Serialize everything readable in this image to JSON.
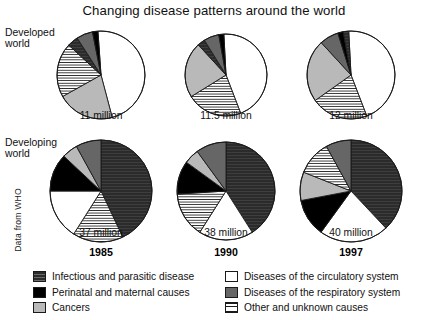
{
  "title": "Changing disease patterns around the world",
  "source_note": "Data from WHO",
  "rows": {
    "developed": "Developed\nworld",
    "developed_line1": "Developed",
    "developed_line2": "world",
    "developing_line1": "Developing",
    "developing_line2": "world"
  },
  "years": [
    "1985",
    "1990",
    "1997"
  ],
  "captions": {
    "developed": [
      "11 million",
      "11.5 million",
      "12 million"
    ],
    "developing": [
      "37 million",
      "38 million",
      "40 million"
    ]
  },
  "legend": {
    "left": [
      {
        "label": "Infectious and parasitic disease",
        "key": "infectious",
        "swatch": "sw-infectious"
      },
      {
        "label": "Perinatal and maternal causes",
        "key": "perinatal",
        "swatch": "sw-perinatal"
      },
      {
        "label": "Cancers",
        "key": "cancers",
        "swatch": "sw-cancers"
      }
    ],
    "right": [
      {
        "label": "Diseases of the circulatory system",
        "key": "circulatory",
        "swatch": "sw-circulatory"
      },
      {
        "label": "Diseases of the respiratory system",
        "key": "respiratory",
        "swatch": "sw-respiratory"
      },
      {
        "label": "Other and unknown causes",
        "key": "other",
        "swatch": "sw-other"
      }
    ]
  },
  "colors": {
    "infectious": "#2b2b2b",
    "perinatal": "#000000",
    "cancers": "#b9b9b9",
    "circulatory": "#ffffff",
    "respiratory": "#666666",
    "other": "#ffffff",
    "outline": "#1a1a1a",
    "text": "#101010",
    "background": "#ffffff"
  },
  "chart_data": {
    "type": "pie",
    "title": "Changing disease patterns around the world",
    "subtitle": "",
    "xlabel": "",
    "ylabel": "",
    "units": "percent of total deaths",
    "legend_position": "bottom",
    "grid": false,
    "categories": [
      "Infectious and parasitic disease",
      "Perinatal and maternal causes",
      "Cancers",
      "Diseases of the circulatory system",
      "Diseases of the respiratory system",
      "Other and unknown causes"
    ],
    "panels": [
      {
        "group": "Developed world",
        "year": "1985",
        "total_label": "11 million",
        "total_millions": 11,
        "values": [
          4,
          2,
          21,
          47,
          6,
          20
        ],
        "slices": [
          {
            "category": "Diseases of the circulatory system",
            "percent": 47,
            "fill": "#ffffff"
          },
          {
            "category": "Cancers",
            "percent": 21,
            "fill": "#b9b9b9"
          },
          {
            "category": "Other and unknown causes",
            "percent": 20,
            "fill": "hatch-horizontal"
          },
          {
            "category": "Infectious and parasitic disease",
            "percent": 4,
            "fill": "#2b2b2b"
          },
          {
            "category": "Diseases of the respiratory system",
            "percent": 6,
            "fill": "#666666"
          },
          {
            "category": "Perinatal and maternal causes",
            "percent": 2,
            "fill": "#000000"
          }
        ]
      },
      {
        "group": "Developed world",
        "year": "1990",
        "total_label": "11.5 million",
        "total_millions": 11.5,
        "values": [
          3,
          2,
          22,
          45,
          6,
          22
        ],
        "slices": [
          {
            "category": "Diseases of the circulatory system",
            "percent": 45,
            "fill": "#ffffff"
          },
          {
            "category": "Other and unknown causes",
            "percent": 22,
            "fill": "hatch-horizontal"
          },
          {
            "category": "Cancers",
            "percent": 22,
            "fill": "#b9b9b9"
          },
          {
            "category": "Infectious and parasitic disease",
            "percent": 3,
            "fill": "#2b2b2b"
          },
          {
            "category": "Diseases of the respiratory system",
            "percent": 6,
            "fill": "#666666"
          },
          {
            "category": "Perinatal and maternal causes",
            "percent": 2,
            "fill": "#000000"
          }
        ]
      },
      {
        "group": "Developed world",
        "year": "1997",
        "total_label": "12 million",
        "total_millions": 12,
        "values": [
          2,
          2,
          23,
          45,
          7,
          21
        ],
        "slices": [
          {
            "category": "Diseases of the circulatory system",
            "percent": 45,
            "fill": "#ffffff"
          },
          {
            "category": "Other and unknown causes",
            "percent": 21,
            "fill": "hatch-horizontal"
          },
          {
            "category": "Cancers",
            "percent": 23,
            "fill": "#b9b9b9"
          },
          {
            "category": "Diseases of the respiratory system",
            "percent": 7,
            "fill": "#666666"
          },
          {
            "category": "Perinatal and maternal causes",
            "percent": 2,
            "fill": "#000000"
          },
          {
            "category": "Infectious and parasitic disease",
            "percent": 2,
            "fill": "#2b2b2b"
          }
        ]
      },
      {
        "group": "Developing world",
        "year": "1985",
        "total_label": "37 million",
        "total_millions": 37,
        "values": [
          43,
          12,
          5,
          16,
          4,
          20
        ],
        "slices": [
          {
            "category": "Infectious and parasitic disease",
            "percent": 43,
            "fill": "#2b2b2b"
          },
          {
            "category": "Other and unknown causes",
            "percent": 16,
            "fill": "hatch-horizontal"
          },
          {
            "category": "Diseases of the circulatory system",
            "percent": 16,
            "fill": "#ffffff"
          },
          {
            "category": "Perinatal and maternal causes",
            "percent": 12,
            "fill": "#000000"
          },
          {
            "category": "Cancers",
            "percent": 5,
            "fill": "#b9b9b9"
          },
          {
            "category": "Diseases of the respiratory system",
            "percent": 8,
            "fill": "#666666"
          }
        ]
      },
      {
        "group": "Developing world",
        "year": "1990",
        "total_label": "38 million",
        "total_millions": 38,
        "values": [
          41,
          11,
          5,
          18,
          5,
          20
        ],
        "slices": [
          {
            "category": "Infectious and parasitic disease",
            "percent": 41,
            "fill": "#2b2b2b"
          },
          {
            "category": "Diseases of the circulatory system",
            "percent": 18,
            "fill": "#ffffff"
          },
          {
            "category": "Other and unknown causes",
            "percent": 15,
            "fill": "hatch-horizontal"
          },
          {
            "category": "Perinatal and maternal causes",
            "percent": 11,
            "fill": "#000000"
          },
          {
            "category": "Cancers",
            "percent": 5,
            "fill": "#b9b9b9"
          },
          {
            "category": "Diseases of the respiratory system",
            "percent": 10,
            "fill": "#666666"
          }
        ]
      },
      {
        "group": "Developing world",
        "year": "1997",
        "total_label": "40 million",
        "total_millions": 40,
        "values": [
          38,
          12,
          8,
          22,
          9,
          11
        ],
        "slices": [
          {
            "category": "Infectious and parasitic disease",
            "percent": 38,
            "fill": "#2b2b2b"
          },
          {
            "category": "Diseases of the circulatory system",
            "percent": 22,
            "fill": "#ffffff"
          },
          {
            "category": "Perinatal and maternal causes",
            "percent": 12,
            "fill": "#000000"
          },
          {
            "category": "Cancers",
            "percent": 9,
            "fill": "#b9b9b9"
          },
          {
            "category": "Other and unknown causes",
            "percent": 11,
            "fill": "hatch-horizontal"
          },
          {
            "category": "Diseases of the respiratory system",
            "percent": 8,
            "fill": "#666666"
          }
        ]
      }
    ]
  }
}
